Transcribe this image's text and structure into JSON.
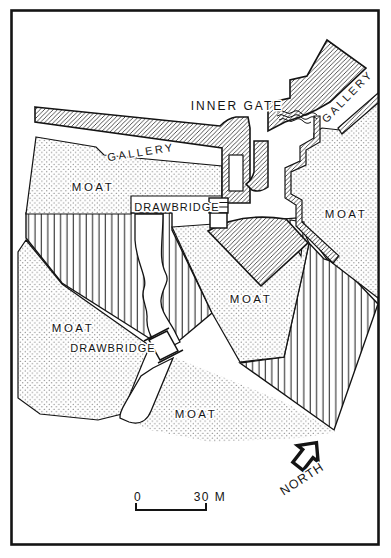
{
  "map": {
    "labels": {
      "inner_gate": "INNER GATE",
      "gallery_left": "GALLERY",
      "gallery_right": "GALLERY",
      "moat_upper_left": "MOAT",
      "moat_right": "MOAT",
      "moat_center": "MOAT",
      "moat_left": "MOAT",
      "moat_bottom": "MOAT",
      "drawbridge_upper": "DRAWBRIDGE",
      "drawbridge_lower": "DRAWBRIDGE"
    },
    "compass": {
      "north": "NORTH"
    },
    "scale_bar": {
      "zero": "0",
      "max": "30 M"
    },
    "colors": {
      "ink": "#141414",
      "paper": "#ffffff"
    }
  }
}
